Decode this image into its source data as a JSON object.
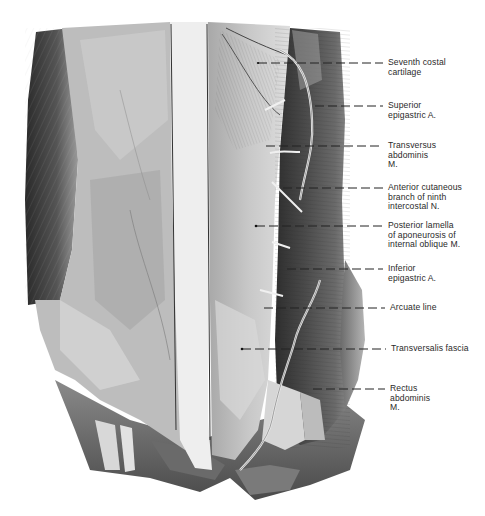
{
  "figure": {
    "background": "#ffffff",
    "ink": "#1a1a1a",
    "labels": [
      {
        "id": "seventh-costal-cartilage",
        "lines": [
          "Seventh costal",
          "cartilage"
        ],
        "x": 388,
        "y": 60,
        "leader_y": 63,
        "leader_x_start": 258
      },
      {
        "id": "superior-epigastric-a",
        "lines": [
          "Superior",
          "epigastric A."
        ],
        "x": 388,
        "y": 104,
        "leader_y": 106,
        "leader_x_start": 315
      },
      {
        "id": "transversus-abdominis-m",
        "lines": [
          "Transversus",
          "abdominis",
          "M."
        ],
        "x": 388,
        "y": 142,
        "leader_y": 146,
        "leader_x_start": 266
      },
      {
        "id": "anterior-cutaneous-branch",
        "lines": [
          "Anterior cutaneous",
          "branch of ninth",
          "intercostal N."
        ],
        "x": 388,
        "y": 183,
        "leader_y": 188,
        "leader_x_start": 283
      },
      {
        "id": "posterior-lamella",
        "lines": [
          "Posterior lamella",
          "of aponeurosis of",
          "internal oblique M."
        ],
        "x": 388,
        "y": 222,
        "leader_y": 226,
        "leader_x_start": 256
      },
      {
        "id": "inferior-epigastric-a",
        "lines": [
          "Inferior",
          "epigastric A."
        ],
        "x": 388,
        "y": 265,
        "leader_y": 269,
        "leader_x_start": 287
      },
      {
        "id": "arcuate-line",
        "lines": [
          "Arcuate line"
        ],
        "x": 390,
        "y": 304,
        "leader_y": 308,
        "leader_x_start": 264
      },
      {
        "id": "transversalis-fascia",
        "lines": [
          "Transversalis fascia"
        ],
        "x": 391,
        "y": 344,
        "leader_y": 349,
        "leader_x_start": 242
      },
      {
        "id": "rectus-abdominis-m",
        "lines": [
          "Rectus",
          "abdominis",
          "M."
        ],
        "x": 390,
        "y": 384,
        "leader_y": 389,
        "leader_x_start": 313
      }
    ]
  },
  "labels_text": {
    "seventh-costal-cartilage": "Seventh costal\ncartilage",
    "superior-epigastric-a": "Superior\nepigastric A.",
    "transversus-abdominis-m": "Transversus\nabdominis\nM.",
    "anterior-cutaneous-branch": "Anterior cutaneous\nbranch of ninth\nintercostal N.",
    "posterior-lamella": "Posterior lamella\nof aponeurosis of\ninternal oblique M.",
    "inferior-epigastric-a": "Inferior\nepigastric A.",
    "arcuate-line": "Arcuate line",
    "transversalis-fascia": "Transversalis fascia",
    "rectus-abdominis-m": "Rectus\nabdominis\nM."
  }
}
